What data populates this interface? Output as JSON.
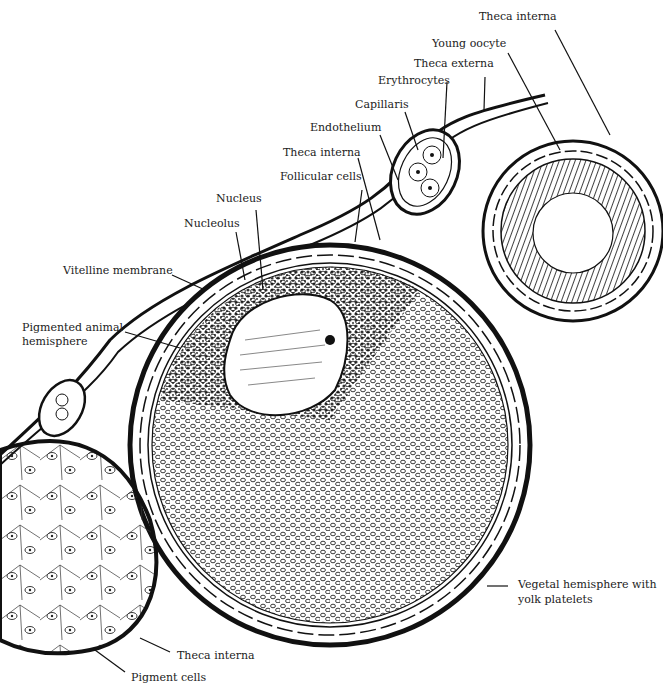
{
  "diagram": {
    "labels": {
      "theca_interna_top": "Theca interna",
      "young_oocyte": "Young oocyte",
      "theca_externa": "Theca externa",
      "erythrocytes": "Erythrocytes",
      "capillaris": "Capillaris",
      "endothelium": "Endothelium",
      "theca_interna_mid": "Theca interna",
      "follicular_cells": "Follicular cells",
      "nucleus": "Nucleus",
      "nucleolus": "Nucleolus",
      "vitelline_membrane": "Vitelline membrane",
      "pigmented_animal_hemisphere_1": "Pigmented animal",
      "pigmented_animal_hemisphere_2": "hemisphere",
      "vegetal_hemisphere_1": "Vegetal hemisphere with",
      "vegetal_hemisphere_2": "yolk platelets",
      "theca_interna_bottom": "Theca interna",
      "pigment_cells": "Pigment cells"
    }
  }
}
